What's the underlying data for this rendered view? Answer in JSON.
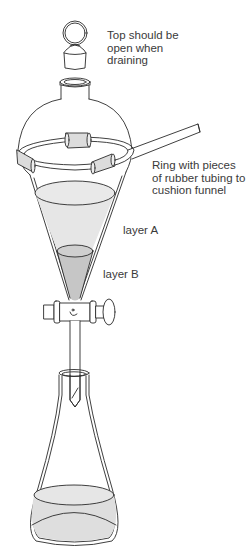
{
  "diagram": {
    "labels": {
      "top_note": [
        "Top should be",
        "open when",
        "draining"
      ],
      "ring_note": [
        "Ring with pieces",
        "of rubber tubing to",
        "cushion funnel"
      ],
      "layer_a": "layer A",
      "layer_b": "layer B"
    },
    "components": [
      "stopper",
      "funnel-neck",
      "separatory-funnel",
      "support-ring",
      "rubber-tubing-pieces",
      "layer-a-liquid",
      "layer-b-liquid",
      "stopcock",
      "drain-stem",
      "erlenmeyer-flask",
      "collected-liquid"
    ],
    "colors": {
      "line": "#2a2a2a",
      "liquid_a": "#e4e4e4",
      "liquid_b": "#c4c4c4",
      "tubing": "#dcdcdc",
      "background": "#ffffff"
    }
  }
}
